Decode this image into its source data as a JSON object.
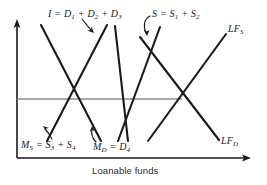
{
  "figure": {
    "background": "#ffffff",
    "ink_color": "#1a1a1a",
    "equilibrium_line_color": "#8c8c8c"
  },
  "axes": {
    "x_label": "Loanable funds",
    "y_label": "",
    "x_axis": {
      "x1": 17,
      "y1": 158,
      "x2": 250,
      "y2": 158,
      "arrow": "right"
    },
    "y_axis": {
      "x1": 17,
      "y1": 158,
      "x2": 17,
      "y2": 22,
      "arrow": "up"
    }
  },
  "equilibrium_line": {
    "x1": 17,
    "y1": 99,
    "x2": 182,
    "y2": 99
  },
  "curve_labels": [
    {
      "id": "investment",
      "text": "I = D1 + D2 + D3",
      "parts": [
        "I",
        " = ",
        "D",
        "1",
        " + ",
        "D",
        "2",
        " + ",
        "D",
        "3"
      ]
    },
    {
      "id": "saving",
      "text": "S = S1 + S2",
      "parts": [
        "S",
        " = ",
        "S",
        "1",
        " + ",
        "S",
        "2"
      ]
    },
    {
      "id": "loanable-supply",
      "text": "LFS",
      "parts": [
        "LF",
        "S"
      ]
    },
    {
      "id": "loanable-demand",
      "text": "LFD",
      "parts": [
        "LF",
        "D"
      ]
    },
    {
      "id": "money-supply",
      "text": "MS = S3 + S4",
      "parts": [
        "M",
        "S",
        " = ",
        "S",
        "3",
        " + ",
        "S",
        "4"
      ]
    },
    {
      "id": "money-demand",
      "text": "MD = D4",
      "parts": [
        "M",
        "D",
        " = ",
        "D",
        "4"
      ]
    }
  ],
  "curves": [
    {
      "id": "investment-curve",
      "label": "I = D1 + D2 + D3",
      "slope": "downward",
      "x1": 41,
      "y1": 25,
      "x2": 101,
      "y2": 141
    },
    {
      "id": "money-supply-curve",
      "label": "MS = S3 + S4",
      "slope": "upward",
      "x1": 47,
      "y1": 141,
      "x2": 107,
      "y2": 25
    },
    {
      "id": "saving-curve",
      "label": "S = S1 + S2",
      "slope": "downward",
      "x1": 115,
      "y1": 26,
      "x2": 128,
      "y2": 141
    },
    {
      "id": "money-demand-curve",
      "label": "MD = D4",
      "slope": "upward",
      "x1": 118,
      "y1": 141,
      "x2": 160,
      "y2": 27
    },
    {
      "id": "loanable-supply-curve",
      "label": "LFS",
      "slope": "upward",
      "x1": 148,
      "y1": 141,
      "x2": 226,
      "y2": 34
    },
    {
      "id": "loanable-demand-curve",
      "label": "LFD",
      "slope": "downward",
      "x1": 140,
      "y1": 37,
      "x2": 219,
      "y2": 140
    }
  ],
  "annotation_arrows": [
    {
      "id": "arrow-to-investment",
      "from": "I = D1 + D2 + D3",
      "to": "investment-curve"
    },
    {
      "id": "arrow-to-saving",
      "from": "S = S1 + S2",
      "to": "saving-curve"
    },
    {
      "id": "arrow-to-money-supply",
      "from": "MS = S3 + S4",
      "to": "money-supply-curve"
    },
    {
      "id": "arrow-to-money-demand",
      "from": "MD = D4",
      "to": "money-demand-curve"
    }
  ]
}
